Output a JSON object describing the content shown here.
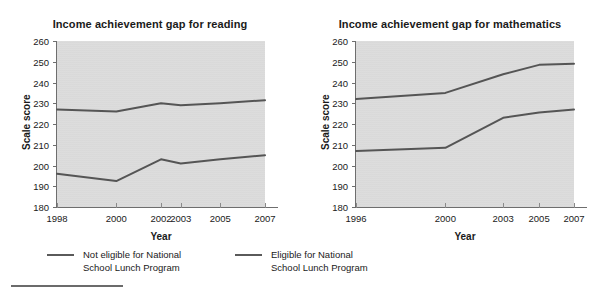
{
  "figure": {
    "background_color": "#ffffff",
    "plot_background_color": "#dcdcdc",
    "line_color": "#555555"
  },
  "legend": {
    "items": [
      {
        "id": "not-eligible",
        "label_line1": "Not eligible for National",
        "label_line2": "School Lunch Program",
        "color": "#5a5a5a"
      },
      {
        "id": "eligible",
        "label_line1": "Eligible for National",
        "label_line2": "School Lunch Program",
        "color": "#5a5a5a"
      }
    ]
  },
  "chart_data": [
    {
      "id": "reading",
      "type": "line",
      "title": "Income achievement gap for reading",
      "xlabel": "Year",
      "ylabel": "Scale score",
      "categories": [
        "1998",
        "2000",
        "2002",
        "2003",
        "2005",
        "2007"
      ],
      "x_positions": [
        0.0,
        0.285,
        0.5,
        0.595,
        0.785,
        1.0
      ],
      "ylim": [
        180,
        260
      ],
      "yticks": [
        180,
        190,
        200,
        210,
        220,
        230,
        240,
        250,
        260
      ],
      "grid": false,
      "legend_position": "below-figure",
      "series": [
        {
          "name": "Not eligible for National School Lunch Program",
          "values": [
            227,
            226,
            230,
            229,
            230,
            231.5
          ]
        },
        {
          "name": "Eligible for National School Lunch Program",
          "values": [
            196,
            192.5,
            203,
            201,
            203,
            205
          ]
        }
      ]
    },
    {
      "id": "mathematics",
      "type": "line",
      "title": "Income achievement gap for mathematics",
      "xlabel": "Year",
      "ylabel": "Scale score",
      "categories": [
        "1996",
        "2000",
        "2003",
        "2005",
        "2007"
      ],
      "x_positions": [
        0.0,
        0.41,
        0.675,
        0.84,
        1.0
      ],
      "ylim": [
        180,
        260
      ],
      "yticks": [
        180,
        190,
        200,
        210,
        220,
        230,
        240,
        250,
        260
      ],
      "grid": false,
      "legend_position": "below-figure",
      "series": [
        {
          "name": "Not eligible for National School Lunch Program",
          "values": [
            232,
            235,
            244,
            248.5,
            249
          ]
        },
        {
          "name": "Eligible for National School Lunch Program",
          "values": [
            207,
            208.5,
            223,
            225.5,
            227
          ]
        }
      ]
    }
  ]
}
